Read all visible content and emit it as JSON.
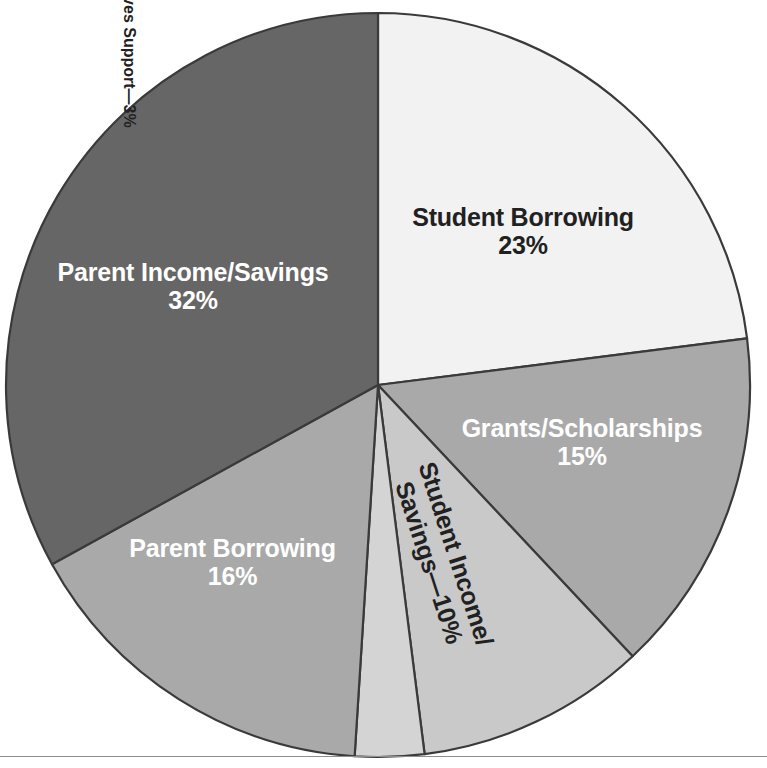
{
  "chart_data": {
    "type": "pie",
    "title": "",
    "subtitle": "",
    "xlabel": "",
    "ylabel": "",
    "legend_position": "none",
    "grid": false,
    "start_angle_deg": 0,
    "direction": "clockwise",
    "total": 99,
    "units": "percent",
    "categories": [
      "Student Borrowing",
      "Grants/Scholarships",
      "Student Income/Savings",
      "Friends/Relatives Support",
      "Parent Borrowing",
      "Parent Income/Savings"
    ],
    "values": [
      23,
      15,
      10,
      3,
      16,
      32
    ],
    "slices": [
      {
        "name": "Student Borrowing",
        "value": 23,
        "label": "Student Borrowing",
        "value_label": "23%",
        "color": "#f2f2f2",
        "text_color": "#212121",
        "start_deg": 0,
        "end_deg": 82.8
      },
      {
        "name": "Grants/Scholarships",
        "value": 15,
        "label": "Grants/Scholarships",
        "value_label": "15%",
        "color": "#a9a9a9",
        "text_color": "#ffffff",
        "start_deg": 82.8,
        "end_deg": 136.8
      },
      {
        "name": "Student Income/Savings",
        "value": 10,
        "label": "Student Income/",
        "label_line2": "Savings—10%",
        "value_label": "10%",
        "color": "#c9c9c9",
        "text_color": "#212121",
        "start_deg": 136.8,
        "end_deg": 172.8
      },
      {
        "name": "Friends/Relatives Support",
        "value": 3,
        "label": "Friends/Relatives Support—3%",
        "value_label": "3%",
        "color": "#d4d4d4",
        "text_color": "#212121",
        "start_deg": 172.8,
        "end_deg": 183.6
      },
      {
        "name": "Parent Borrowing",
        "value": 16,
        "label": "Parent Borrowing",
        "value_label": "16%",
        "color": "#a9a9a9",
        "text_color": "#ffffff",
        "start_deg": 183.6,
        "end_deg": 241.2
      },
      {
        "name": "Parent Income/Savings",
        "value": 32,
        "label": "Parent Income/Savings",
        "value_label": "32%",
        "color": "#666666",
        "text_color": "#ffffff",
        "start_deg": 241.2,
        "end_deg": 360
      }
    ],
    "geometry": {
      "center_x": 378,
      "center_y": 385,
      "radius": 372
    },
    "colors": {
      "background": "#ffffff",
      "outline": "#3a3a3a",
      "rule": "#8d8d8d"
    }
  }
}
